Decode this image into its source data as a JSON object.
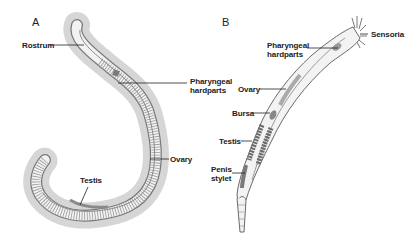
{
  "figure": {
    "panels": [
      {
        "id": "A",
        "label": "A",
        "annotations": [
          {
            "key": "rostrum",
            "text": "Rostrum"
          },
          {
            "key": "pharyngeal_hardparts",
            "text": "Pharyngeal hardparts",
            "line1": "Pharyngeal",
            "line2": "hardparts"
          },
          {
            "key": "ovary",
            "text": "Ovary"
          },
          {
            "key": "testis",
            "text": "Testis"
          }
        ]
      },
      {
        "id": "B",
        "label": "B",
        "annotations": [
          {
            "key": "sensoria",
            "text": "Sensoria"
          },
          {
            "key": "pharyngeal_hardparts",
            "text": "Pharyngeal hardparts",
            "line1": "Pharyngeal",
            "line2": "hardparts"
          },
          {
            "key": "ovary",
            "text": "Ovary"
          },
          {
            "key": "bursa",
            "text": "Bursa"
          },
          {
            "key": "testis",
            "text": "Testis"
          },
          {
            "key": "penis_stylet",
            "text": "Penis stylet",
            "line1": "Penis",
            "line2": "stylet"
          }
        ]
      }
    ],
    "colors": {
      "outline": "#6a6a6a",
      "cilia": "#bdbdbd",
      "organ": "#8a8a8a",
      "leader": "#222222"
    }
  }
}
